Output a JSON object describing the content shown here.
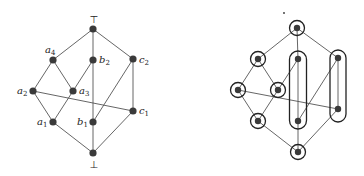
{
  "left_diagram": {
    "title": "lattice",
    "nodes": [
      {
        "id": "top",
        "label": "⊤",
        "x": 93,
        "y": 29
      },
      {
        "id": "a4",
        "label": "a",
        "sub": "4",
        "x": 53,
        "y": 60
      },
      {
        "id": "b2",
        "label": "b",
        "sub": "2",
        "x": 93,
        "y": 60
      },
      {
        "id": "c2",
        "label": "c",
        "sub": "2",
        "x": 133,
        "y": 59
      },
      {
        "id": "a2",
        "label": "a",
        "sub": "2",
        "x": 33,
        "y": 91
      },
      {
        "id": "a3",
        "label": "a",
        "sub": "3",
        "x": 73,
        "y": 91
      },
      {
        "id": "c1",
        "label": "c",
        "sub": "1",
        "x": 133,
        "y": 111
      },
      {
        "id": "a1",
        "label": "a",
        "sub": "1",
        "x": 53,
        "y": 122
      },
      {
        "id": "b1",
        "label": "b",
        "sub": "1",
        "x": 93,
        "y": 122
      },
      {
        "id": "bottom",
        "label": "⊥",
        "x": 93,
        "y": 153
      }
    ],
    "edges": [
      [
        "top",
        "a4"
      ],
      [
        "top",
        "b2"
      ],
      [
        "top",
        "c2"
      ],
      [
        "a4",
        "a2"
      ],
      [
        "a4",
        "a3"
      ],
      [
        "b2",
        "a3"
      ],
      [
        "b2",
        "b1"
      ],
      [
        "c2",
        "b1"
      ],
      [
        "c2",
        "c1"
      ],
      [
        "a2",
        "a1"
      ],
      [
        "a2",
        "c1"
      ],
      [
        "a3",
        "a1"
      ],
      [
        "a1",
        "bottom"
      ],
      [
        "b1",
        "bottom"
      ],
      [
        "c1",
        "bottom"
      ]
    ]
  },
  "right_diagram": {
    "title": "lattice-partition",
    "singleton_circles": [
      "top",
      "a4",
      "a2",
      "a3",
      "a1",
      "bottom"
    ],
    "pill_groups": [
      {
        "id": "b-block",
        "members": [
          "b2",
          "b1"
        ]
      },
      {
        "id": "c-block",
        "members": [
          "c2",
          "c1"
        ]
      }
    ]
  }
}
